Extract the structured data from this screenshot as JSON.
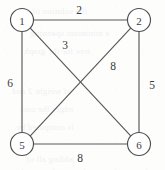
{
  "figure": {
    "kind": "weighted-undirected-graph",
    "width": 165,
    "height": 170,
    "background_color": "#fdfdfc",
    "line_color": "#58585a",
    "text_color": "#3a3a3c"
  },
  "nodes": [
    {
      "id": "1",
      "label": "1",
      "cx": 22,
      "cy": 20,
      "r": 11.5
    },
    {
      "id": "2",
      "label": "2",
      "cx": 139,
      "cy": 20,
      "r": 11.5
    },
    {
      "id": "5",
      "label": "5",
      "cx": 22,
      "cy": 144,
      "r": 11.5
    },
    {
      "id": "6",
      "label": "6",
      "cx": 139,
      "cy": 144,
      "r": 11.5
    }
  ],
  "edges": [
    {
      "id": "e12",
      "from": "1",
      "to": "2",
      "weight": "2",
      "x1": 33.5,
      "y1": 20,
      "x2": 127.5,
      "y2": 20,
      "label_x": 79,
      "label_y": 10
    },
    {
      "id": "e15",
      "from": "1",
      "to": "5",
      "weight": "6",
      "x1": 22,
      "y1": 31.5,
      "x2": 22,
      "y2": 132.5,
      "label_x": 10,
      "label_y": 83
    },
    {
      "id": "e26",
      "from": "2",
      "to": "6",
      "weight": "5",
      "x1": 139,
      "y1": 31.5,
      "x2": 139,
      "y2": 132.5,
      "label_x": 152,
      "label_y": 85
    },
    {
      "id": "e56",
      "from": "5",
      "to": "6",
      "weight": "8",
      "x1": 33.5,
      "y1": 144,
      "x2": 127.5,
      "y2": 144,
      "label_x": 80,
      "label_y": 158
    },
    {
      "id": "e16",
      "from": "1",
      "to": "6",
      "weight": "3",
      "x1": 30.3,
      "y1": 28.1,
      "x2": 130.7,
      "y2": 135.9,
      "label_x": 65,
      "label_y": 45
    },
    {
      "id": "e25",
      "from": "2",
      "to": "5",
      "weight": "8",
      "x1": 130.7,
      "y1": 28.1,
      "x2": 30.3,
      "y2": 135.9,
      "label_x": 113,
      "label_y": 66
    }
  ],
  "ghost_text": [
    {
      "text": "the solution of the",
      "x": 18,
      "y": 6
    },
    {
      "text": "a minimum spanning",
      "x": 30,
      "y": 28
    },
    {
      "text": "tree for the graph",
      "x": 24,
      "y": 46
    },
    {
      "text": "of weight 2 and",
      "x": 12,
      "y": 86
    },
    {
      "text": "edges the cost",
      "x": 20,
      "y": 104
    },
    {
      "text": "is computed by",
      "x": 16,
      "y": 122
    },
    {
      "text": "adding all of",
      "x": 26,
      "y": 154
    }
  ]
}
